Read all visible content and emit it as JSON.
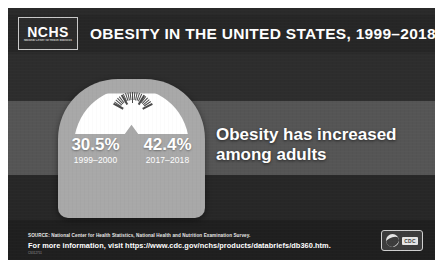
{
  "header": {
    "logo_main": "NCHS",
    "logo_sub": "National Center for Health Statistics",
    "title": "OBESITY IN THE UNITED STATES, 1999–2018"
  },
  "scale": {
    "stats": [
      {
        "percent": "30.5%",
        "years": "1999–2000"
      },
      {
        "percent": "42.4%",
        "years": "2017–2018"
      }
    ]
  },
  "headline": "Obesity has increased among adults",
  "footer": {
    "source": "SOURCE: National Center for Health Statistics, National Health and Nutrition Examination Survey.",
    "url_line": "For more information, visit https://www.cdc.gov/nchs/products/databriefs/db360.htm.",
    "tiny_label": "CS312751",
    "cdc_word": "CDC"
  },
  "colors": {
    "poster_dark": "#2a2a2a",
    "poster_mid": "#555555",
    "scale_body": "#a8a8a8",
    "dial_white": "#ffffff",
    "text_white": "#ffffff"
  }
}
